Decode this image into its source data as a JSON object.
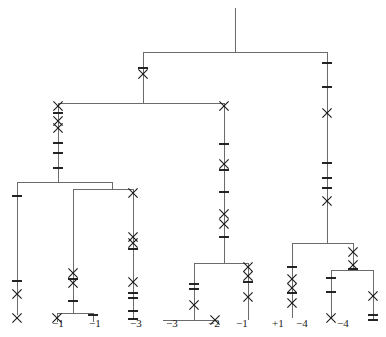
{
  "figure": {
    "type": "phylogenetic-tree-cladogram",
    "orientation": "top-down",
    "line_color": "#6b6b6b",
    "mark_color": "#1a1a1a",
    "background": "#ffffff",
    "width": 386,
    "height": 337
  },
  "leaf_labels": [
    {
      "text": "−1",
      "x": 52,
      "y": 318
    },
    {
      "text": "−1",
      "x": 89,
      "y": 318
    },
    {
      "text": "−3",
      "x": 130,
      "y": 318
    },
    {
      "text": "−3",
      "x": 166,
      "y": 318
    },
    {
      "text": "−2",
      "x": 208,
      "y": 318
    },
    {
      "text": "−1",
      "x": 236,
      "y": 318
    },
    {
      "text": "+1",
      "x": 272,
      "y": 318
    },
    {
      "text": "−4",
      "x": 296,
      "y": 318
    },
    {
      "text": "−4",
      "x": 337,
      "y": 318
    }
  ],
  "edges": [
    {
      "name": "root-stem",
      "x1": 235,
      "y1": 8,
      "x2": 235,
      "y2": 52
    },
    {
      "name": "root-crossbar",
      "x1": 143,
      "y1": 52,
      "x2": 327,
      "y2": 52
    },
    {
      "name": "node-a-stem",
      "x1": 143,
      "y1": 52,
      "x2": 143,
      "y2": 103
    },
    {
      "name": "node-a-crossbar",
      "x1": 58,
      "y1": 103,
      "x2": 224,
      "y2": 103
    },
    {
      "name": "right-clade-stem",
      "x1": 327,
      "y1": 52,
      "x2": 327,
      "y2": 243
    },
    {
      "name": "node-b-stem",
      "x1": 58,
      "y1": 103,
      "x2": 58,
      "y2": 182
    },
    {
      "name": "node-b-crossbar",
      "x1": 17,
      "y1": 182,
      "x2": 112,
      "y2": 182
    },
    {
      "name": "leaf-1-stem",
      "x1": 17,
      "y1": 182,
      "x2": 17,
      "y2": 315
    },
    {
      "name": "node-c-stem",
      "x1": 112,
      "y1": 182,
      "x2": 112,
      "y2": 189
    },
    {
      "name": "node-c-crossbar",
      "x1": 73,
      "y1": 189,
      "x2": 133,
      "y2": 189
    },
    {
      "name": "node-d-stem",
      "x1": 73,
      "y1": 189,
      "x2": 73,
      "y2": 313
    },
    {
      "name": "node-d-crossbar",
      "x1": 57,
      "y1": 313,
      "x2": 93,
      "y2": 313
    },
    {
      "name": "leaf-2-stem",
      "x1": 57,
      "y1": 313,
      "x2": 57,
      "y2": 322
    },
    {
      "name": "leaf-3-stem",
      "x1": 93,
      "y1": 313,
      "x2": 93,
      "y2": 322
    },
    {
      "name": "leaf-4-stem",
      "x1": 133,
      "y1": 189,
      "x2": 133,
      "y2": 320
    },
    {
      "name": "mid-clade-stem",
      "x1": 224,
      "y1": 103,
      "x2": 224,
      "y2": 263
    },
    {
      "name": "mid-clade-crossbar",
      "x1": 194,
      "y1": 263,
      "x2": 248,
      "y2": 263
    },
    {
      "name": "node-e-stem",
      "x1": 194,
      "y1": 263,
      "x2": 194,
      "y2": 320
    },
    {
      "name": "node-e-crossbar",
      "x1": 163,
      "y1": 320,
      "x2": 215,
      "y2": 320
    },
    {
      "name": "leaf-6-stem",
      "x1": 248,
      "y1": 263,
      "x2": 248,
      "y2": 320
    },
    {
      "name": "right-crossbar",
      "x1": 292,
      "y1": 243,
      "x2": 353,
      "y2": 243
    },
    {
      "name": "leaf-7-stem",
      "x1": 292,
      "y1": 243,
      "x2": 292,
      "y2": 318
    },
    {
      "name": "node-f-stem",
      "x1": 353,
      "y1": 243,
      "x2": 353,
      "y2": 270
    },
    {
      "name": "node-f-crossbar",
      "x1": 331,
      "y1": 270,
      "x2": 373,
      "y2": 270
    },
    {
      "name": "leaf-8-stem",
      "x1": 331,
      "y1": 270,
      "x2": 331,
      "y2": 318
    },
    {
      "name": "leaf-9-stem",
      "x1": 373,
      "y1": 270,
      "x2": 373,
      "y2": 320
    }
  ],
  "marks": [
    {
      "kind": "tick",
      "x": 143,
      "y": 68
    },
    {
      "kind": "x",
      "x": 143,
      "y": 74
    },
    {
      "kind": "x",
      "x": 58,
      "y": 106
    },
    {
      "kind": "tick",
      "x": 58,
      "y": 113
    },
    {
      "kind": "x",
      "x": 58,
      "y": 121
    },
    {
      "kind": "x",
      "x": 58,
      "y": 128
    },
    {
      "kind": "tick",
      "x": 58,
      "y": 143
    },
    {
      "kind": "tick",
      "x": 58,
      "y": 153
    },
    {
      "kind": "tick",
      "x": 58,
      "y": 168
    },
    {
      "kind": "tick",
      "x": 17,
      "y": 196
    },
    {
      "kind": "tick",
      "x": 17,
      "y": 281
    },
    {
      "kind": "x",
      "x": 17,
      "y": 294
    },
    {
      "kind": "x",
      "x": 17,
      "y": 318
    },
    {
      "kind": "x",
      "x": 73,
      "y": 273
    },
    {
      "kind": "tick",
      "x": 73,
      "y": 279
    },
    {
      "kind": "x",
      "x": 73,
      "y": 283
    },
    {
      "kind": "tick",
      "x": 73,
      "y": 301
    },
    {
      "kind": "x",
      "x": 57,
      "y": 318
    },
    {
      "kind": "tick",
      "x": 93,
      "y": 315
    },
    {
      "kind": "x",
      "x": 133,
      "y": 193
    },
    {
      "kind": "x",
      "x": 133,
      "y": 237
    },
    {
      "kind": "x",
      "x": 133,
      "y": 243
    },
    {
      "kind": "tick",
      "x": 133,
      "y": 249
    },
    {
      "kind": "x",
      "x": 133,
      "y": 282
    },
    {
      "kind": "tick",
      "x": 133,
      "y": 293
    },
    {
      "kind": "tick",
      "x": 133,
      "y": 298
    },
    {
      "kind": "tick",
      "x": 133,
      "y": 311
    },
    {
      "kind": "tick",
      "x": 133,
      "y": 319
    },
    {
      "kind": "x",
      "x": 224,
      "y": 106
    },
    {
      "kind": "tick",
      "x": 224,
      "y": 144
    },
    {
      "kind": "x",
      "x": 224,
      "y": 164
    },
    {
      "kind": "tick",
      "x": 224,
      "y": 170
    },
    {
      "kind": "tick",
      "x": 224,
      "y": 192
    },
    {
      "kind": "x",
      "x": 224,
      "y": 214
    },
    {
      "kind": "x",
      "x": 224,
      "y": 224
    },
    {
      "kind": "tick",
      "x": 224,
      "y": 237
    },
    {
      "kind": "tick",
      "x": 194,
      "y": 284
    },
    {
      "kind": "tick",
      "x": 194,
      "y": 289
    },
    {
      "kind": "x",
      "x": 194,
      "y": 305
    },
    {
      "kind": "x",
      "x": 215,
      "y": 320
    },
    {
      "kind": "x",
      "x": 248,
      "y": 267
    },
    {
      "kind": "x",
      "x": 248,
      "y": 276
    },
    {
      "kind": "tick",
      "x": 248,
      "y": 282
    },
    {
      "kind": "x",
      "x": 248,
      "y": 297
    },
    {
      "kind": "tick",
      "x": 327,
      "y": 63
    },
    {
      "kind": "tick",
      "x": 327,
      "y": 87
    },
    {
      "kind": "x",
      "x": 327,
      "y": 113
    },
    {
      "kind": "tick",
      "x": 327,
      "y": 163
    },
    {
      "kind": "tick",
      "x": 327,
      "y": 178
    },
    {
      "kind": "tick",
      "x": 327,
      "y": 188
    },
    {
      "kind": "x",
      "x": 327,
      "y": 201
    },
    {
      "kind": "tick",
      "x": 292,
      "y": 267
    },
    {
      "kind": "x",
      "x": 292,
      "y": 279
    },
    {
      "kind": "x",
      "x": 292,
      "y": 288
    },
    {
      "kind": "tick",
      "x": 292,
      "y": 293
    },
    {
      "kind": "x",
      "x": 292,
      "y": 303
    },
    {
      "kind": "x",
      "x": 353,
      "y": 252
    },
    {
      "kind": "x",
      "x": 353,
      "y": 265
    },
    {
      "kind": "tick",
      "x": 353,
      "y": 269
    },
    {
      "kind": "tick",
      "x": 331,
      "y": 278
    },
    {
      "kind": "tick",
      "x": 331,
      "y": 292
    },
    {
      "kind": "x",
      "x": 331,
      "y": 318
    },
    {
      "kind": "x",
      "x": 373,
      "y": 296
    },
    {
      "kind": "tick",
      "x": 373,
      "y": 315
    },
    {
      "kind": "tick",
      "x": 373,
      "y": 320
    }
  ]
}
